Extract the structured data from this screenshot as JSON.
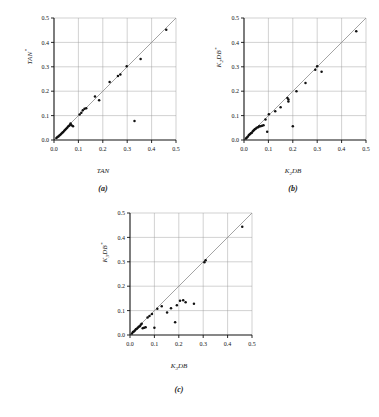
{
  "figure": {
    "background": "#ffffff",
    "point_color": "#111111",
    "line_color": "#8d8d8d",
    "grid_color": "#9a9a9a"
  },
  "panels": [
    {
      "id": "a",
      "caption": "(a)",
      "xlabel": "TAN",
      "ylabel_base": "TAN",
      "ylabel_sup": "*",
      "ylabel_sub": ""
    },
    {
      "id": "b",
      "caption": "(b)",
      "xlabel_base": "K",
      "xlabel_sub": "2",
      "xlabel_tail": "DB",
      "ylabel_base": "K",
      "ylabel_sub": "2",
      "ylabel_tail": "DB",
      "ylabel_sup": "*"
    },
    {
      "id": "c",
      "caption": "(c)",
      "xlabel_base": "K",
      "xlabel_sub": "3",
      "xlabel_tail": "DB",
      "ylabel_base": "K",
      "ylabel_sub": "3",
      "ylabel_tail": "DB",
      "ylabel_sup": "*"
    }
  ],
  "chart_data": [
    {
      "type": "scatter",
      "panel": "a",
      "title": "",
      "xlabel": "TAN",
      "ylabel": "TAN*",
      "xlim": [
        0.0,
        0.5
      ],
      "ylim": [
        0.0,
        0.5
      ],
      "xticks": [
        0.0,
        0.1,
        0.2,
        0.3,
        0.4,
        0.5
      ],
      "yticks": [
        0.0,
        0.1,
        0.2,
        0.3,
        0.4,
        0.5
      ],
      "xticklabels": [
        "0.0",
        "0.1",
        "0.2",
        "0.3",
        "0.4",
        "0.5"
      ],
      "yticklabels": [
        "0.0",
        "0.1",
        "0.2",
        "0.3",
        "0.4",
        "0.5"
      ],
      "grid": true,
      "legend": "none",
      "reference_line": {
        "type": "identity",
        "from": [
          0.0,
          0.0
        ],
        "to": [
          0.5,
          0.5
        ]
      },
      "points": [
        [
          0.01,
          0.008
        ],
        [
          0.014,
          0.012
        ],
        [
          0.018,
          0.014
        ],
        [
          0.022,
          0.018
        ],
        [
          0.026,
          0.022
        ],
        [
          0.03,
          0.026
        ],
        [
          0.034,
          0.03
        ],
        [
          0.038,
          0.033
        ],
        [
          0.042,
          0.038
        ],
        [
          0.046,
          0.042
        ],
        [
          0.05,
          0.046
        ],
        [
          0.054,
          0.05
        ],
        [
          0.058,
          0.055
        ],
        [
          0.062,
          0.058
        ],
        [
          0.066,
          0.062
        ],
        [
          0.068,
          0.068
        ],
        [
          0.072,
          0.06
        ],
        [
          0.078,
          0.056
        ],
        [
          0.105,
          0.104
        ],
        [
          0.112,
          0.112
        ],
        [
          0.118,
          0.122
        ],
        [
          0.125,
          0.128
        ],
        [
          0.132,
          0.13
        ],
        [
          0.168,
          0.178
        ],
        [
          0.185,
          0.163
        ],
        [
          0.228,
          0.238
        ],
        [
          0.262,
          0.262
        ],
        [
          0.272,
          0.268
        ],
        [
          0.298,
          0.302
        ],
        [
          0.33,
          0.078
        ],
        [
          0.355,
          0.332
        ],
        [
          0.46,
          0.452
        ]
      ]
    },
    {
      "type": "scatter",
      "panel": "b",
      "title": "",
      "xlabel": "K2DB",
      "ylabel": "K2DB*",
      "xlim": [
        0.0,
        0.5
      ],
      "ylim": [
        0.0,
        0.5
      ],
      "xticks": [
        0.0,
        0.1,
        0.2,
        0.3,
        0.4,
        0.5
      ],
      "yticks": [
        0.0,
        0.1,
        0.2,
        0.3,
        0.4,
        0.5
      ],
      "xticklabels": [
        "0.0",
        "0.1",
        "0.2",
        "0.3",
        "0.4",
        "0.5"
      ],
      "yticklabels": [
        "0.0",
        "0.1",
        "0.2",
        "0.3",
        "0.4",
        "0.5"
      ],
      "grid": true,
      "legend": "none",
      "reference_line": {
        "type": "identity",
        "from": [
          0.0,
          0.0
        ],
        "to": [
          0.5,
          0.5
        ]
      },
      "points": [
        [
          0.008,
          0.006
        ],
        [
          0.012,
          0.01
        ],
        [
          0.016,
          0.014
        ],
        [
          0.02,
          0.02
        ],
        [
          0.024,
          0.024
        ],
        [
          0.028,
          0.028
        ],
        [
          0.032,
          0.03
        ],
        [
          0.036,
          0.036
        ],
        [
          0.04,
          0.04
        ],
        [
          0.044,
          0.044
        ],
        [
          0.048,
          0.046
        ],
        [
          0.052,
          0.05
        ],
        [
          0.058,
          0.052
        ],
        [
          0.062,
          0.056
        ],
        [
          0.068,
          0.056
        ],
        [
          0.074,
          0.058
        ],
        [
          0.08,
          0.06
        ],
        [
          0.088,
          0.084
        ],
        [
          0.095,
          0.034
        ],
        [
          0.102,
          0.106
        ],
        [
          0.128,
          0.118
        ],
        [
          0.15,
          0.134
        ],
        [
          0.178,
          0.172
        ],
        [
          0.182,
          0.166
        ],
        [
          0.182,
          0.158
        ],
        [
          0.2,
          0.056
        ],
        [
          0.215,
          0.2
        ],
        [
          0.252,
          0.234
        ],
        [
          0.292,
          0.288
        ],
        [
          0.3,
          0.302
        ],
        [
          0.318,
          0.28
        ],
        [
          0.46,
          0.446
        ]
      ]
    },
    {
      "type": "scatter",
      "panel": "c",
      "title": "",
      "xlabel": "K3DB",
      "ylabel": "K3DB*",
      "xlim": [
        0.0,
        0.5
      ],
      "ylim": [
        0.0,
        0.5
      ],
      "xticks": [
        0.0,
        0.1,
        0.2,
        0.3,
        0.4,
        0.5
      ],
      "yticks": [
        0.0,
        0.1,
        0.2,
        0.3,
        0.4,
        0.5
      ],
      "xticklabels": [
        "0.0",
        "0.1",
        "0.2",
        "0.3",
        "0.4",
        "0.5"
      ],
      "yticklabels": [
        "0.0",
        "0.1",
        "0.2",
        "0.3",
        "0.4",
        "0.5"
      ],
      "grid": true,
      "legend": "none",
      "reference_line": {
        "type": "identity",
        "from": [
          0.0,
          0.0
        ],
        "to": [
          0.5,
          0.5
        ]
      },
      "points": [
        [
          0.008,
          0.006
        ],
        [
          0.012,
          0.012
        ],
        [
          0.016,
          0.014
        ],
        [
          0.02,
          0.018
        ],
        [
          0.024,
          0.024
        ],
        [
          0.028,
          0.026
        ],
        [
          0.032,
          0.03
        ],
        [
          0.036,
          0.034
        ],
        [
          0.04,
          0.036
        ],
        [
          0.044,
          0.042
        ],
        [
          0.048,
          0.046
        ],
        [
          0.052,
          0.028
        ],
        [
          0.058,
          0.03
        ],
        [
          0.064,
          0.032
        ],
        [
          0.072,
          0.072
        ],
        [
          0.08,
          0.078
        ],
        [
          0.09,
          0.086
        ],
        [
          0.1,
          0.03
        ],
        [
          0.112,
          0.108
        ],
        [
          0.13,
          0.118
        ],
        [
          0.152,
          0.092
        ],
        [
          0.168,
          0.11
        ],
        [
          0.185,
          0.052
        ],
        [
          0.192,
          0.122
        ],
        [
          0.205,
          0.14
        ],
        [
          0.218,
          0.142
        ],
        [
          0.228,
          0.134
        ],
        [
          0.262,
          0.128
        ],
        [
          0.305,
          0.298
        ],
        [
          0.31,
          0.306
        ],
        [
          0.46,
          0.444
        ]
      ]
    }
  ]
}
